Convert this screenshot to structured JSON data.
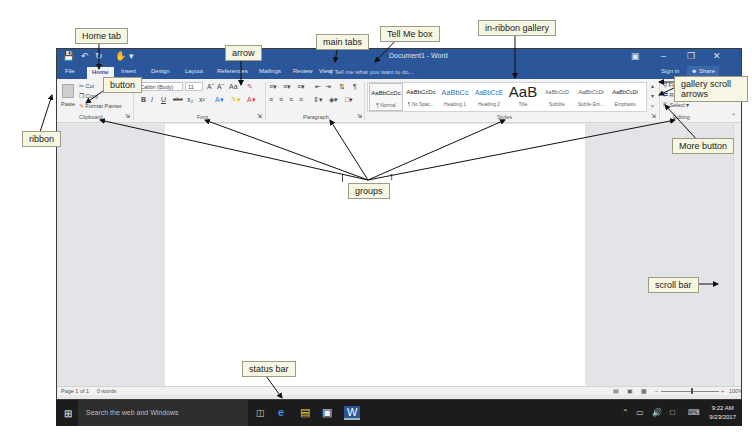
{
  "window": {
    "title": "Document1 - Word",
    "qat_icons": [
      "save-icon",
      "undo-icon",
      "redo-icon",
      "touch-mode-icon"
    ],
    "controls": [
      "ribbon-display-icon",
      "minimize-icon",
      "restore-icon",
      "close-icon"
    ],
    "sign_in": "Sign in",
    "share": "Share"
  },
  "tabs": [
    {
      "label": "File"
    },
    {
      "label": "Home",
      "active": true
    },
    {
      "label": "Insert"
    },
    {
      "label": "Design"
    },
    {
      "label": "Layout"
    },
    {
      "label": "References"
    },
    {
      "label": "Mailings"
    },
    {
      "label": "Review"
    },
    {
      "label": "View"
    }
  ],
  "tell_me": {
    "placeholder": "Tell me what you want to do..."
  },
  "ribbon": {
    "clipboard": {
      "label": "Clipboard",
      "paste": "Paste",
      "cut": "Cut",
      "copy": "Copy",
      "format_painter": "Format Painter"
    },
    "font": {
      "label": "Font",
      "font_name": "Calibri (Body)",
      "font_size": "11",
      "grow": "Aˆ",
      "shrink": "Aˇ",
      "change_case": "Aa",
      "bold": "B",
      "italic": "I",
      "underline": "U",
      "strikethrough": "abc",
      "subscript": "x₂",
      "superscript": "x²"
    },
    "paragraph": {
      "label": "Paragraph"
    },
    "styles": {
      "label": "Styles",
      "items": [
        {
          "preview": "AaBbCcDc",
          "name": "¶ Normal",
          "color": "#222222",
          "size": 6
        },
        {
          "preview": "AaBbCcDc",
          "name": "¶ No Spac...",
          "color": "#222222",
          "size": 6
        },
        {
          "preview": "AaBbCc",
          "name": "Heading 1",
          "color": "#2e74b5",
          "size": 7.5
        },
        {
          "preview": "AaBbCcE",
          "name": "Heading 2",
          "color": "#2e74b5",
          "size": 6.5
        },
        {
          "preview": "AaB",
          "name": "Title",
          "color": "#222222",
          "size": 15
        },
        {
          "preview": "AaBbCcD",
          "name": "Subtitle",
          "color": "#666666",
          "size": 5.5
        },
        {
          "preview": "AaBbCcDi",
          "name": "Subtle Em...",
          "color": "#555555",
          "size": 5.5
        },
        {
          "preview": "AaBbCcDi",
          "name": "Emphasis",
          "color": "#333333",
          "size": 5.5
        }
      ]
    },
    "editing": {
      "label": "Editing",
      "find": "Find",
      "replace": "Replace",
      "select": "Select"
    }
  },
  "status_bar": {
    "page": "Page 1 of 1",
    "words": "0 words",
    "zoom": "100%"
  },
  "taskbar": {
    "search_placeholder": "Search the web and Windows",
    "time": "9:22 AM",
    "date": "9/23/2017"
  },
  "callouts": {
    "home_tab": "Home tab",
    "arrow": "arrow",
    "main_tabs": "main tabs",
    "tell_me_box": "Tell Me box",
    "in_ribbon_gallery": "in-ribbon gallery",
    "button": "button",
    "gallery_scroll_arrows": "gallery scroll arrows",
    "ribbon": "ribbon",
    "more_button": "More button",
    "groups": "groups",
    "scroll_bar": "scroll bar",
    "status_bar": "status bar"
  }
}
